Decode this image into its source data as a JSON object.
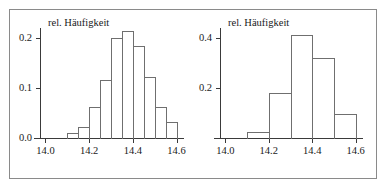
{
  "figure": {
    "title": "",
    "panel_count": 2,
    "frame_color": "#8a8a8a",
    "axis_color": "#3a3a3a",
    "bar_outline_color": "#6f6f6f",
    "bar_fill": "none"
  },
  "chart_data": [
    {
      "type": "bar",
      "panel": "left",
      "title": "",
      "axis_title": "rel. Häufigkeit",
      "xlabel": "",
      "ylabel": "rel. Häufigkeit",
      "xlim": [
        13.975,
        14.625
      ],
      "ylim": [
        0.0,
        0.225
      ],
      "grid": false,
      "legend": null,
      "x_tick_labels": [
        "14.0",
        "14.2",
        "14.4",
        "14.6"
      ],
      "x_tick_values": [
        14.0,
        14.2,
        14.4,
        14.6
      ],
      "x_minor_tick_values": [
        14.05,
        14.1,
        14.15,
        14.25,
        14.3,
        14.35,
        14.45,
        14.5,
        14.55
      ],
      "y_tick_labels": [
        "0.0",
        "0.1",
        "0.2"
      ],
      "y_tick_values": [
        0.0,
        0.1,
        0.2
      ],
      "bin_width": 0.05,
      "bin_edges": [
        14.1,
        14.15,
        14.2,
        14.25,
        14.3,
        14.35,
        14.4,
        14.45,
        14.5,
        14.55,
        14.6
      ],
      "categories": [
        "14.10-14.15",
        "14.15-14.20",
        "14.20-14.25",
        "14.25-14.30",
        "14.30-14.35",
        "14.35-14.40",
        "14.40-14.45",
        "14.45-14.50",
        "14.50-14.55",
        "14.55-14.60"
      ],
      "values": [
        0.01,
        0.022,
        0.062,
        0.115,
        0.2,
        0.213,
        0.183,
        0.122,
        0.062,
        0.032
      ]
    },
    {
      "type": "bar",
      "panel": "right",
      "title": "",
      "axis_title": "rel. Häufigkeit",
      "xlabel": "",
      "ylabel": "rel. Häufigkeit",
      "xlim": [
        13.975,
        14.625
      ],
      "ylim": [
        0.0,
        0.45
      ],
      "grid": false,
      "legend": null,
      "x_tick_labels": [
        "14.0",
        "14.2",
        "14.4",
        "14.6"
      ],
      "x_tick_values": [
        14.0,
        14.2,
        14.4,
        14.6
      ],
      "x_minor_tick_values": [
        14.05,
        14.1,
        14.15,
        14.25,
        14.3,
        14.35,
        14.45,
        14.5,
        14.55
      ],
      "y_tick_labels": [
        "0.2",
        "0.4"
      ],
      "y_tick_values": [
        0.2,
        0.4
      ],
      "bin_width": 0.1,
      "bin_edges": [
        14.1,
        14.2,
        14.3,
        14.4,
        14.5,
        14.6
      ],
      "categories": [
        "14.10-14.20",
        "14.20-14.30",
        "14.30-14.40",
        "14.40-14.50",
        "14.50-14.60"
      ],
      "values": [
        0.025,
        0.178,
        0.41,
        0.32,
        0.095
      ]
    }
  ]
}
